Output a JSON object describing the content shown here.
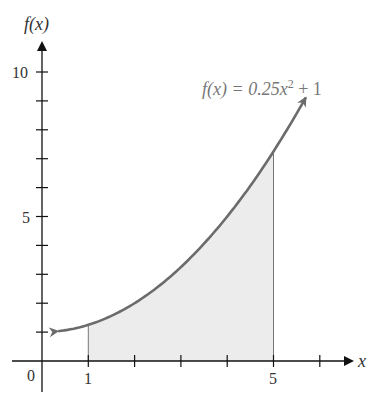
{
  "chart_data": {
    "type": "area",
    "title": "",
    "function_label": "f(x) = 0.25x^2 + 1",
    "function_label_parts": {
      "lhs": "f(x) = 0.25x",
      "exp": "2",
      "rhs": " + 1"
    },
    "xlabel": "x",
    "ylabel": "f(x)",
    "x_tick_labels": [
      "0",
      "1",
      "5"
    ],
    "y_tick_labels": [
      "5",
      "10"
    ],
    "xlim": [
      -0.7,
      6.8
    ],
    "ylim": [
      0,
      10.8
    ],
    "x_ticks": [
      1,
      2,
      3,
      4,
      5,
      6
    ],
    "y_ticks": [
      1,
      2,
      3,
      4,
      5,
      6,
      7,
      8,
      9,
      10
    ],
    "curve": {
      "formula": "0.25*x^2 + 1",
      "x_range": [
        0.35,
        5.7
      ]
    },
    "shaded_region": {
      "x_from": 1,
      "x_to": 5,
      "color": "#ececec"
    },
    "curve_color": "#6b6b6b",
    "grid": false,
    "legend": "none"
  }
}
